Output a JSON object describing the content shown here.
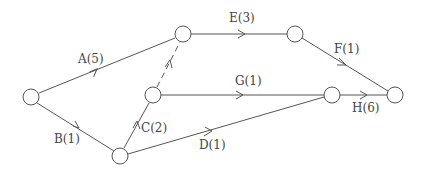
{
  "diagram": {
    "type": "activity-on-arrow network",
    "nodes": [
      {
        "id": "n1",
        "x": 31,
        "y": 97
      },
      {
        "id": "n2",
        "x": 183,
        "y": 34
      },
      {
        "id": "n3",
        "x": 153,
        "y": 95
      },
      {
        "id": "n4",
        "x": 120,
        "y": 156
      },
      {
        "id": "n5",
        "x": 295,
        "y": 34
      },
      {
        "id": "n6",
        "x": 332,
        "y": 95
      },
      {
        "id": "n7",
        "x": 395,
        "y": 95
      }
    ],
    "edges": [
      {
        "id": "A",
        "from": "n1",
        "to": "n2",
        "label": "A(5)",
        "dashed": false
      },
      {
        "id": "B",
        "from": "n1",
        "to": "n4",
        "label": "B(1)",
        "dashed": false
      },
      {
        "id": "C",
        "from": "n4",
        "to": "n3",
        "label": "C(2)",
        "dashed": false
      },
      {
        "id": "D",
        "from": "n4",
        "to": "n6",
        "label": "D(1)",
        "dashed": false
      },
      {
        "id": "dummy",
        "from": "n3",
        "to": "n2",
        "label": "",
        "dashed": true
      },
      {
        "id": "E",
        "from": "n2",
        "to": "n5",
        "label": "E(3)",
        "dashed": false
      },
      {
        "id": "F",
        "from": "n5",
        "to": "n7",
        "label": "F(1)",
        "dashed": false
      },
      {
        "id": "G",
        "from": "n3",
        "to": "n6",
        "label": "G(1)",
        "dashed": false
      },
      {
        "id": "H",
        "from": "n6",
        "to": "n7",
        "label": "H(6)",
        "dashed": false
      }
    ],
    "labels": {
      "A": "A(5)",
      "B": "B(1)",
      "C": "C(2)",
      "D": "D(1)",
      "E": "E(3)",
      "F": "F(1)",
      "G": "G(1)",
      "H": "H(6)"
    }
  }
}
